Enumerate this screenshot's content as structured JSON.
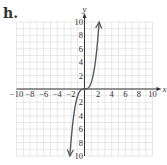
{
  "label": "h.",
  "chart_data": {
    "type": "line",
    "title": "",
    "xlabel": "x",
    "ylabel": "y",
    "xlim": [
      -10,
      10
    ],
    "ylim": [
      -10,
      10
    ],
    "grid": true,
    "x_ticks": [
      "-10",
      "-8",
      "-6",
      "-4",
      "-2",
      "2",
      "4",
      "6",
      "8",
      "10"
    ],
    "y_ticks": [
      "10",
      "8",
      "6",
      "4",
      "2",
      "2",
      "4",
      "6",
      "8",
      "10"
    ],
    "series": [
      {
        "name": "y = x^3",
        "x": [
          -2.15,
          -2,
          -1.5,
          -1,
          -0.5,
          0,
          0.5,
          1,
          1.5,
          2,
          2.15
        ],
        "y": [
          -10,
          -8,
          -3.375,
          -1,
          -0.125,
          0,
          0.125,
          1,
          3.375,
          8,
          10
        ],
        "arrows": "both",
        "color": "#555a63"
      }
    ],
    "colors": {
      "grid": "#d9d9d9",
      "axis": "#333333",
      "curve": "#555a63"
    }
  }
}
